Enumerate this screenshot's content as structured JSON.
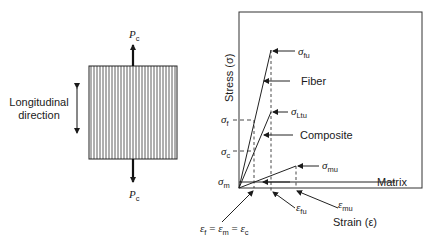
{
  "specimen": {
    "load_top": {
      "symbol": "P",
      "subscript": "c"
    },
    "load_bottom": {
      "symbol": "P",
      "subscript": "c"
    },
    "direction_label_line1": "Longitudinal",
    "direction_label_line2": "direction"
  },
  "chart": {
    "y_axis_label": "Stress (σ)",
    "x_axis_label": "Strain (ε)",
    "y_ticks": [
      {
        "symbol": "σ",
        "subscript": "f"
      },
      {
        "symbol": "σ",
        "subscript": "c"
      },
      {
        "symbol": "σ",
        "subscript": "m"
      }
    ],
    "curve_labels": {
      "fiber": "Fiber",
      "composite": "Composite",
      "matrix": "Matrix"
    },
    "point_labels": {
      "sigma_fu": {
        "symbol": "σ",
        "subscript": "fu"
      },
      "sigma_Ltu": {
        "symbol": "σ",
        "subscript": "Ltu"
      },
      "sigma_mu": {
        "symbol": "σ",
        "subscript": "mu"
      },
      "eps_fu": {
        "symbol": "ε",
        "subscript": "fu"
      },
      "eps_mu": {
        "symbol": "ε",
        "subscript": "mu"
      }
    },
    "strain_equality": {
      "parts": [
        {
          "symbol": "ε",
          "subscript": "f"
        },
        {
          "symbol": "ε",
          "subscript": "m"
        },
        {
          "symbol": "ε",
          "subscript": "c"
        }
      ],
      "separator": "="
    }
  }
}
